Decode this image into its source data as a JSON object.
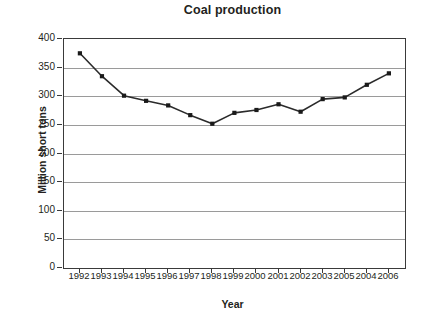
{
  "chart_data": {
    "type": "line",
    "title": "Coal production",
    "xlabel": "Year",
    "ylabel": "Million short tons",
    "categories": [
      "1992",
      "1993",
      "1994",
      "1995",
      "1996",
      "1997",
      "1998",
      "1999",
      "2000",
      "2001",
      "2002",
      "2003",
      "2005",
      "2004",
      "2006"
    ],
    "values": [
      375,
      335,
      301,
      292,
      284,
      267,
      252,
      271,
      276,
      286,
      273,
      295,
      298,
      320,
      340
    ],
    "series": [
      {
        "name": "Coal production",
        "values": [
          375,
          335,
          301,
          292,
          284,
          267,
          252,
          271,
          276,
          286,
          273,
          295,
          298,
          320,
          340
        ]
      }
    ],
    "ylim": [
      0,
      400
    ],
    "ytick_labels": [
      "400",
      "350",
      "300",
      "250",
      "200",
      "150",
      "100",
      "50",
      "0"
    ],
    "ytick_values": [
      400,
      350,
      300,
      250,
      200,
      150,
      100,
      50,
      0
    ],
    "ytick_step": 50,
    "grid": "horizontal",
    "legend": "none",
    "marker": "filled-square",
    "line_color": "#2b2b2b",
    "marker_color": "#1a1a1a",
    "grid_color": "#9a9a9a",
    "axis_color": "#3a3a3a",
    "background_color": "#ffffff",
    "note": "x-axis category labels appear in the printed order 1992-2003, 2005, 2004, 2006"
  }
}
